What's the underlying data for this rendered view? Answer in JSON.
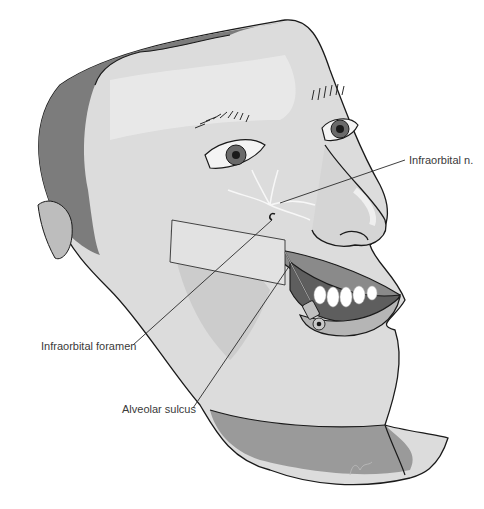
{
  "figure": {
    "labels": [
      {
        "id": "infraorbital-n",
        "text": "Infraorbital n."
      },
      {
        "id": "infraorbital-foramen",
        "text": "Infraorbital foramen"
      },
      {
        "id": "alveolar-sulcus",
        "text": "Alveolar sulcus"
      }
    ]
  },
  "colors": {
    "skin_light": "#e6e6e6",
    "skin_mid": "#c8c8c8",
    "skin_dark": "#8a8a8a",
    "hair": "#777777",
    "outline": "#1a1a1a",
    "leader_line": "#2a2a2a",
    "label_text": "#3a3a3a"
  }
}
